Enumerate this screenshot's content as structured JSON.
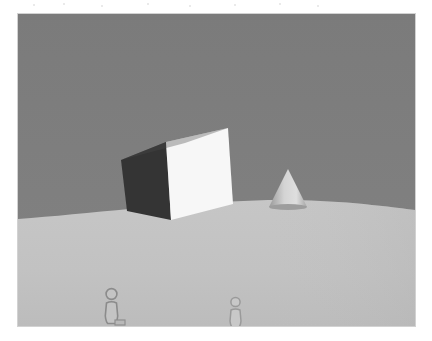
{
  "scene": {
    "title": "3D rendered outdoor scene",
    "description": "A large tilted cube and a small cone floating above a curved light-gray ground plane under a flat gray sky, with two small human figures standing in the foreground.",
    "canvas": {
      "x": 18,
      "y": 14,
      "width": 397,
      "height": 312,
      "page_background": "#ffffff",
      "border_color": "#d2d2d2"
    },
    "sky": {
      "name": "sky-backdrop",
      "color_top": "#7b7b7b",
      "color_bottom": "#828282"
    },
    "ground": {
      "name": "ground-plane",
      "color": "#c2c2c2",
      "shade_color": "#bdbdbd",
      "horizon_left_y": 205,
      "horizon_peak_x": 250,
      "horizon_peak_y": 186,
      "horizon_right_y": 196
    },
    "objects": [
      {
        "name": "cube",
        "label": "Tilted cube",
        "kind": "cube",
        "left": 101,
        "top": 98,
        "width": 122,
        "height": 110,
        "rotation_deg": 17,
        "face_shadow_color": "#343434",
        "face_lit_color": "#f7f7f7",
        "face_top_color": "#ededed",
        "edge_color": "#2c2c2c"
      },
      {
        "name": "cone",
        "label": "Small cone",
        "kind": "cone",
        "left": 248,
        "top": 152,
        "width": 44,
        "height": 46,
        "color_lit": "#d9d9d9",
        "color_shadow": "#949494",
        "base_color": "#8a8a8a"
      },
      {
        "name": "figure-left",
        "label": "Person (left)",
        "kind": "human-figure",
        "left": 83,
        "top": 273,
        "width": 26,
        "height": 40,
        "outline_color": "#8e8e8e",
        "fill_color": "#c2c2c2"
      },
      {
        "name": "figure-right",
        "label": "Person (right)",
        "kind": "human-figure",
        "left": 208,
        "top": 282,
        "width": 20,
        "height": 32,
        "outline_color": "#9a9a9a",
        "fill_color": "#c6c6c6"
      }
    ],
    "palette": {
      "sky": "#7d7d7d",
      "ground": "#c2c2c2",
      "cube_dark": "#343434",
      "cube_light": "#f7f7f7",
      "cone": "#d0d0d0",
      "figure_outline": "#8e8e8e",
      "page": "#ffffff"
    }
  }
}
